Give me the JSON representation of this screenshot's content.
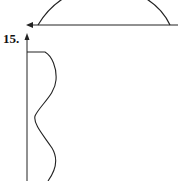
{
  "problem_label": "15.",
  "figures": {
    "top": {
      "description": "Semicircular arc above a horizontal axis with a left-pointing arrow",
      "axis_color": "#222222",
      "curve_color": "#222222"
    },
    "bottom": {
      "description": "Vertical axis with upward arrow and a wavy curve to its right",
      "axis_color": "#222222",
      "curve_color": "#222222"
    }
  }
}
